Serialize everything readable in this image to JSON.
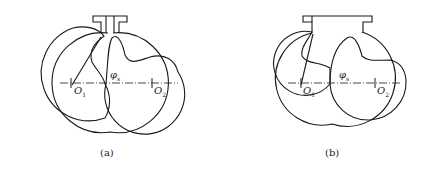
{
  "figures": [
    {
      "id": "a",
      "caption": "(a)",
      "labels": {
        "center_left": "O",
        "center_left_sub": "1",
        "center_right": "O",
        "center_right_sub": "2",
        "angle": "φ",
        "angle_sub": "s"
      }
    },
    {
      "id": "b",
      "caption": "(b)",
      "labels": {
        "center_left": "O",
        "center_left_sub": "1",
        "center_right": "O",
        "center_right_sub": "2",
        "angle": "φ",
        "angle_sub": "s"
      }
    }
  ],
  "colors": {
    "stroke": "#1a1a1a",
    "background": "#ffffff"
  }
}
